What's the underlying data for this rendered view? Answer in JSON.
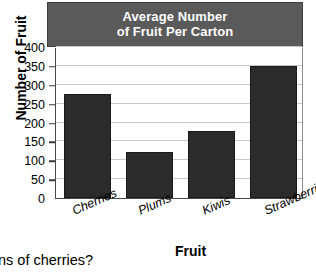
{
  "chart_data": {
    "type": "bar",
    "title": "Average Number of Fruit Per Carton",
    "title_lines": [
      "Average Number",
      "of Fruit Per Carton"
    ],
    "categories": [
      "Cherries",
      "Plums",
      "Kiwis",
      "Strawberries"
    ],
    "values": [
      275,
      123,
      178,
      350
    ],
    "xlabel": "Fruit",
    "ylabel": "Number of Fruit",
    "ylim": [
      0,
      400
    ],
    "yticks": [
      0,
      50,
      100,
      150,
      200,
      250,
      300,
      350,
      400
    ],
    "ytick_labels": [
      "0",
      "50",
      "100",
      "150",
      "200",
      "250",
      "300",
      "350",
      "400"
    ],
    "grid": true,
    "legend": false,
    "bar_color": "#2b2b2b",
    "title_bar_color": "#5a5a5a",
    "title_text_color": "#ffffff",
    "gridline_color": "#c9c9c9"
  },
  "page": {
    "question_fragment": "ns of cherries?"
  }
}
